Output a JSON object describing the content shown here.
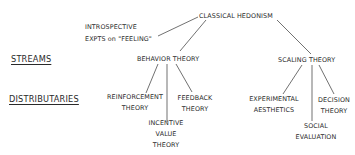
{
  "diagram": {
    "root": {
      "id": "classical-hedonism",
      "label": "CLASSICAL HEDONISM"
    },
    "side_note": {
      "lines": [
        "INTROSPECTIVE",
        "EXPTS on \"FEELING\""
      ]
    },
    "row_labels": {
      "streams": "STREAMS",
      "distributaries": "DISTRIBUTARIES"
    },
    "streams": [
      {
        "id": "behavior-theory",
        "label": "BEHAVIOR THEORY"
      },
      {
        "id": "scaling-theory",
        "label": "SCALING THEORY"
      }
    ],
    "distributaries": {
      "behavior": [
        {
          "id": "reinforcement-theory",
          "lines": [
            "REINFORCEMENT",
            "THEORY"
          ]
        },
        {
          "id": "incentive-value-theory",
          "lines": [
            "INCENTIVE",
            "VALUE",
            "THEORY"
          ]
        },
        {
          "id": "feedback-theory",
          "lines": [
            "FEEDBACK",
            "THEORY"
          ]
        }
      ],
      "scaling": [
        {
          "id": "experimental-aesthetics",
          "lines": [
            "EXPERIMENTAL",
            "AESTHETICS"
          ]
        },
        {
          "id": "social-evaluation",
          "lines": [
            "SOCIAL",
            "EVALUATION"
          ]
        },
        {
          "id": "decision-theory",
          "lines": [
            "DECISION",
            "THEORY"
          ]
        }
      ]
    },
    "edges": [
      [
        "classical-hedonism",
        "introspective-expts"
      ],
      [
        "classical-hedonism",
        "behavior-theory"
      ],
      [
        "classical-hedonism",
        "scaling-theory"
      ],
      [
        "behavior-theory",
        "reinforcement-theory"
      ],
      [
        "behavior-theory",
        "incentive-value-theory"
      ],
      [
        "behavior-theory",
        "feedback-theory"
      ],
      [
        "scaling-theory",
        "experimental-aesthetics"
      ],
      [
        "scaling-theory",
        "social-evaluation"
      ],
      [
        "scaling-theory",
        "decision-theory"
      ]
    ],
    "line_color": "#333333"
  }
}
